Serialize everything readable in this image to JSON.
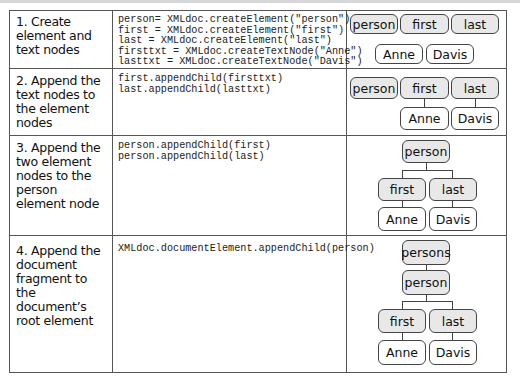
{
  "rows": [
    {
      "step": "1. Create element and text nodes",
      "code": "person= XMLdoc.createElement(\"person\")\nfirst = XMLdoc.createElement(\"first\")\nlast = XMLdoc.createElement(\"last\")\nfirsttxt = XMLdoc.createTextNode(\"Anne\")\nlasttxt = XMLdoc.createTextNode(\"Davis\")",
      "nodes": {
        "person": "person",
        "first": "first",
        "last": "last",
        "anne": "Anne",
        "davis": "Davis"
      }
    },
    {
      "step": "2. Append the text nodes to the element nodes",
      "code": "first.appendChild(firsttxt)\nlast.appendChild(lasttxt)",
      "nodes": {
        "person": "person",
        "first": "first",
        "last": "last",
        "anne": "Anne",
        "davis": "Davis"
      }
    },
    {
      "step": "3. Append the two element nodes to the person element node",
      "code": "person.appendChild(first)\nperson.appendChild(last)",
      "nodes": {
        "person": "person",
        "first": "first",
        "last": "last",
        "anne": "Anne",
        "davis": "Davis"
      }
    },
    {
      "step": "4. Append the document fragment to the document’s root element",
      "code": "XMLdoc.documentElement.appendChild(person)",
      "nodes": {
        "persons": "persons",
        "person": "person",
        "first": "first",
        "last": "last",
        "anne": "Anne",
        "davis": "Davis"
      }
    }
  ],
  "colors": {
    "element_fill": "#e8e8e8",
    "text_fill": "#ffffff",
    "border": "#444444"
  }
}
